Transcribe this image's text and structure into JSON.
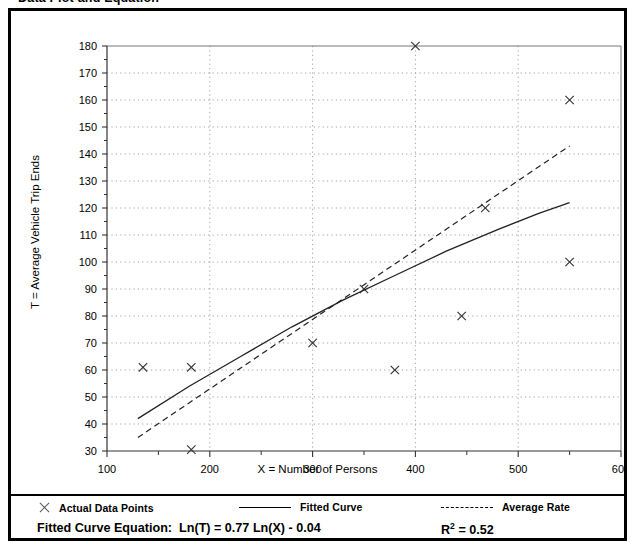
{
  "heading": "Data Plot and Equation",
  "axis_titles": {
    "x": "X = Number of Persons",
    "y": "T = Average Vehicle Trip Ends"
  },
  "legend": {
    "items": [
      {
        "label": "Actual Data Points",
        "marker": "x-marker-icon"
      },
      {
        "label": "Fitted Curve",
        "marker": "solid-line-icon"
      },
      {
        "label": "Average Rate",
        "marker": "dashed-line-icon"
      }
    ]
  },
  "equation": {
    "label": "Fitted Curve Equation:",
    "formula": "Ln(T) = 0.77 Ln(X) - 0.04",
    "r2_symbol": "R",
    "r2_exponent": "2",
    "r2_value": "= 0.52"
  },
  "chart_data": {
    "type": "scatter",
    "title": "Data Plot and Equation",
    "xlabel": "X = Number of Persons",
    "ylabel": "T = Average Vehicle Trip Ends",
    "xlim": [
      100,
      600
    ],
    "ylim": [
      30,
      180
    ],
    "xticks": [
      100,
      200,
      300,
      400,
      500,
      600
    ],
    "yticks": [
      30,
      40,
      50,
      60,
      70,
      80,
      90,
      100,
      110,
      120,
      130,
      140,
      150,
      160,
      170,
      180
    ],
    "x_minor_tick_step": 50,
    "grid": true,
    "grid_style": "dotted",
    "legend_position": "below-plot",
    "series": [
      {
        "name": "Actual Data Points",
        "type": "scatter",
        "marker": "x",
        "points": [
          {
            "x": 135,
            "y": 61
          },
          {
            "x": 182,
            "y": 61
          },
          {
            "x": 182,
            "y": 30.5
          },
          {
            "x": 300,
            "y": 70
          },
          {
            "x": 350,
            "y": 90
          },
          {
            "x": 380,
            "y": 60
          },
          {
            "x": 400,
            "y": 180
          },
          {
            "x": 445,
            "y": 80
          },
          {
            "x": 468,
            "y": 120
          },
          {
            "x": 550,
            "y": 160
          },
          {
            "x": 550,
            "y": 100
          }
        ]
      },
      {
        "name": "Fitted Curve",
        "type": "line",
        "style": "solid",
        "equation": "Ln(T) = 0.77 Ln(X) - 0.04",
        "points": [
          {
            "x": 130,
            "y": 42
          },
          {
            "x": 180,
            "y": 54
          },
          {
            "x": 230,
            "y": 65
          },
          {
            "x": 280,
            "y": 76
          },
          {
            "x": 330,
            "y": 86
          },
          {
            "x": 380,
            "y": 95
          },
          {
            "x": 430,
            "y": 104
          },
          {
            "x": 480,
            "y": 112
          },
          {
            "x": 520,
            "y": 118
          },
          {
            "x": 550,
            "y": 122
          }
        ]
      },
      {
        "name": "Average Rate",
        "type": "line",
        "style": "dashed",
        "points": [
          {
            "x": 130,
            "y": 35
          },
          {
            "x": 550,
            "y": 143
          }
        ]
      }
    ]
  }
}
